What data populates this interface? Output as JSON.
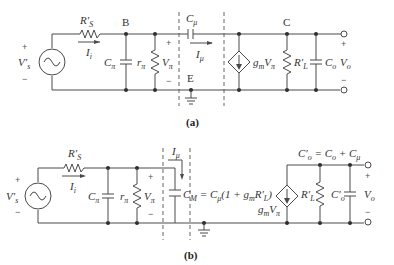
{
  "figure": {
    "panels": [
      {
        "id": "a",
        "caption": "(a)",
        "nodes": {
          "base": "B",
          "emitter": "E",
          "collector": "C"
        },
        "source": {
          "label": "V",
          "prime": "′",
          "sub": "s",
          "plus": "+",
          "minus": "−"
        },
        "components": {
          "rs": {
            "label": "R",
            "prime": "′",
            "sub": "S"
          },
          "ii": {
            "label": "I",
            "sub": "i"
          },
          "cpi": {
            "label": "C",
            "sub": "π"
          },
          "rpi": {
            "label": "r",
            "sub": "π"
          },
          "vpi": {
            "label": "V",
            "sub": "π",
            "plus": "+",
            "minus": "−"
          },
          "cmu": {
            "label": "C",
            "sub": "μ"
          },
          "imu": {
            "label": "I",
            "sub": "μ"
          },
          "gm": {
            "label": "g",
            "sub": "m",
            "v": "V",
            "vsub": "π"
          },
          "rl": {
            "label": "R",
            "prime": "′",
            "sub": "L"
          },
          "co": {
            "label": "C",
            "sub": "o"
          },
          "vo": {
            "label": "V",
            "sub": "o",
            "plus": "+",
            "minus": "−"
          }
        }
      },
      {
        "id": "b",
        "caption": "(b)",
        "source": {
          "label": "V",
          "prime": "′",
          "sub": "s",
          "plus": "+",
          "minus": "−"
        },
        "components": {
          "rs": {
            "label": "R",
            "prime": "′",
            "sub": "S"
          },
          "ii": {
            "label": "I",
            "sub": "i"
          },
          "cpi": {
            "label": "C",
            "sub": "π"
          },
          "rpi": {
            "label": "r",
            "sub": "π"
          },
          "vpi": {
            "label": "V",
            "sub": "π",
            "plus": "+",
            "minus": "−"
          },
          "imu": {
            "label": "I",
            "sub": "μ"
          },
          "cm": {
            "label": "C",
            "sub": "M",
            "eq": " = C",
            "eqsub": "μ",
            "eq2": "(1 + g",
            "eqsub2": "m",
            "eq3": "R",
            "eqprime": "′",
            "eqsub3": "L",
            "eq4": ")"
          },
          "gm": {
            "label": "g",
            "sub": "m",
            "v": "V",
            "vsub": "π"
          },
          "rl": {
            "label": "R",
            "prime": "′",
            "sub": "L"
          },
          "co": {
            "label": "C",
            "prime": "′",
            "sub": "o"
          },
          "coeq": {
            "lhs": "C",
            "lhsprime": "′",
            "lhssub": "o",
            "mid": " = C",
            "midsub": "o",
            "plus": " + C",
            "plussub": "μ"
          },
          "vo": {
            "label": "V",
            "sub": "o",
            "plus": "+",
            "minus": "−"
          }
        }
      }
    ]
  }
}
